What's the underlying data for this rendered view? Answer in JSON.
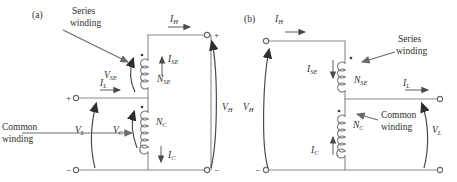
{
  "figure": {
    "type": "circuit-diagram",
    "background_color": "#ffffff",
    "line_color": "#808080",
    "text_color": "#2e2e2e"
  },
  "panel_a": {
    "tag": "(a)",
    "annotations": {
      "series_winding_line1": "Series",
      "series_winding_line2": "winding",
      "common_winding_line1": "Common",
      "common_winding_line2": "winding"
    },
    "labels": {
      "i_h": "I",
      "i_h_sub": "H",
      "i_se": "I",
      "i_se_sub": "SE",
      "n_se": "N",
      "n_se_sub": "SE",
      "i_l": "I",
      "i_l_sub": "L",
      "v_se": "V",
      "v_se_sub": "SE",
      "v_l": "V",
      "v_l_sub": "L",
      "v_c": "V",
      "v_c_sub": "C",
      "n_c": "N",
      "n_c_sub": "C",
      "i_c": "I",
      "i_c_sub": "C",
      "v_h": "V",
      "v_h_sub": "H"
    },
    "polarity": {
      "left_top": "+",
      "left_bottom": "−",
      "right_top": "+",
      "right_bottom": "−"
    }
  },
  "panel_b": {
    "tag": "(b)",
    "annotations": {
      "series_winding_line1": "Series",
      "series_winding_line2": "winding",
      "common_winding_line1": "Common",
      "common_winding_line2": "winding"
    },
    "labels": {
      "i_h": "I",
      "i_h_sub": "H",
      "i_se": "I",
      "i_se_sub": "SE",
      "n_se": "N",
      "n_se_sub": "SE",
      "i_l": "I",
      "i_l_sub": "L",
      "v_h": "V",
      "v_h_sub": "H",
      "n_c": "N",
      "n_c_sub": "C",
      "i_c": "I",
      "i_c_sub": "C",
      "v_l": "V",
      "v_l_sub": "L"
    },
    "polarity": {
      "left_bottom": "−"
    }
  }
}
